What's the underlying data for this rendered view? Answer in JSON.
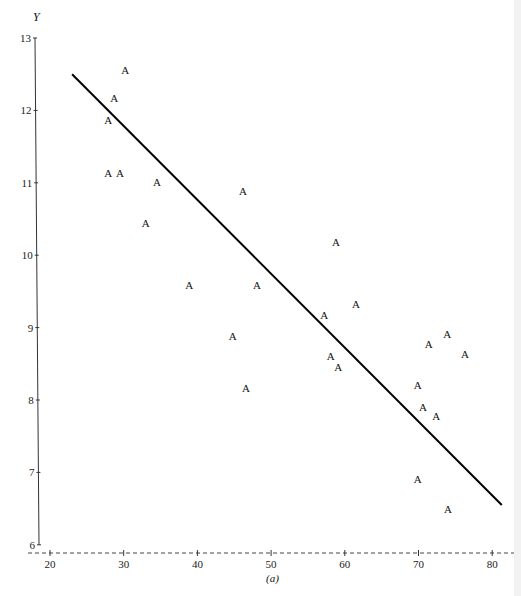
{
  "chart_data": {
    "type": "scatter",
    "title": "",
    "caption": "(a)",
    "xlabel": "",
    "ylabel": "Y",
    "xlim": [
      18,
      82
    ],
    "ylim": [
      5.9,
      13
    ],
    "grid": false,
    "legend": null,
    "marker_label": "A",
    "x_ticks": [
      20,
      30,
      40,
      50,
      60,
      70,
      80
    ],
    "y_ticks": [
      6,
      7,
      8,
      9,
      10,
      11,
      12,
      13
    ],
    "points": [
      {
        "x": 30.2,
        "y": 12.56
      },
      {
        "x": 28.7,
        "y": 12.17
      },
      {
        "x": 27.9,
        "y": 11.87
      },
      {
        "x": 27.9,
        "y": 11.14
      },
      {
        "x": 29.5,
        "y": 11.14
      },
      {
        "x": 34.5,
        "y": 11.01
      },
      {
        "x": 33.0,
        "y": 10.44
      },
      {
        "x": 46.2,
        "y": 10.89
      },
      {
        "x": 58.8,
        "y": 10.18
      },
      {
        "x": 38.9,
        "y": 9.59
      },
      {
        "x": 48.1,
        "y": 9.59
      },
      {
        "x": 61.5,
        "y": 9.33
      },
      {
        "x": 57.2,
        "y": 9.17
      },
      {
        "x": 44.8,
        "y": 8.88
      },
      {
        "x": 58.1,
        "y": 8.61
      },
      {
        "x": 59.1,
        "y": 8.46
      },
      {
        "x": 46.6,
        "y": 8.17
      },
      {
        "x": 73.9,
        "y": 8.91
      },
      {
        "x": 71.4,
        "y": 8.77
      },
      {
        "x": 76.3,
        "y": 8.64
      },
      {
        "x": 69.9,
        "y": 8.21
      },
      {
        "x": 70.6,
        "y": 7.9
      },
      {
        "x": 72.4,
        "y": 7.78
      },
      {
        "x": 69.9,
        "y": 6.91
      },
      {
        "x": 74.0,
        "y": 6.49
      }
    ],
    "fit_line": {
      "x1": 23.0,
      "y1": 12.5,
      "x2": 81.3,
      "y2": 6.55
    }
  }
}
